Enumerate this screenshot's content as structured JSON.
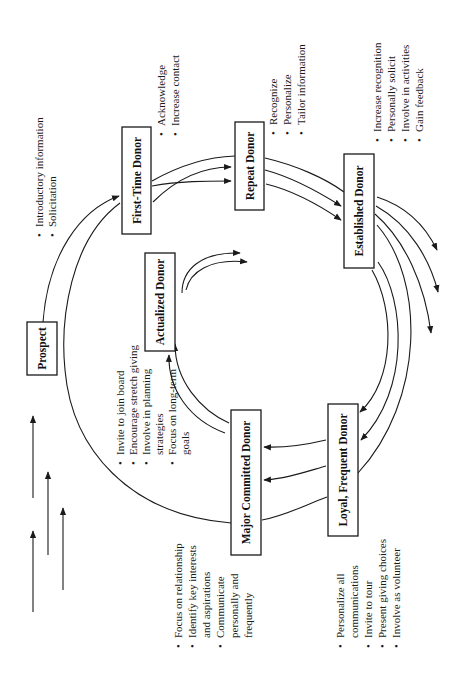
{
  "diagram": {
    "orientation": "rotated 90 degrees counter-clockwise",
    "nodes": [
      {
        "id": "prospect",
        "label": "Prospect"
      },
      {
        "id": "first_time",
        "label": "First-Time Donor"
      },
      {
        "id": "repeat",
        "label": "Repeat Donor"
      },
      {
        "id": "established",
        "label": "Established Donor"
      },
      {
        "id": "loyal",
        "label": "Loyal, Frequent Donor"
      },
      {
        "id": "major",
        "label": "Major Committed Donor"
      },
      {
        "id": "actualized",
        "label": "Actualized Donor"
      }
    ],
    "bullets": {
      "prospect": [
        "Introductory information",
        "Solicitation"
      ],
      "first_time": [
        "Acknowledge",
        "Increase contact"
      ],
      "repeat": [
        "Recognize",
        "Personalize",
        "Tailor information"
      ],
      "established": [
        "Increase recognition",
        "Personally solicit",
        "Involve in activities",
        "Gain feedback"
      ],
      "loyal": [
        "Personalize all",
        "communications",
        "Invite to tour",
        "Present giving choices",
        "Involve as volunteer"
      ],
      "major": [
        "Invite to join board",
        "Encourage stretch giving",
        "Involve in planning",
        "strategies",
        "Focus on long-term",
        "goals"
      ],
      "relationship": [
        "Focus on relationship",
        "Identify key interests",
        "and aspirations",
        "Communicate",
        "personally and",
        "frequently"
      ]
    },
    "edges": [
      {
        "from": "prospect",
        "to": "first_time"
      },
      {
        "from": "first_time",
        "to": "repeat"
      },
      {
        "from": "repeat",
        "to": "established"
      },
      {
        "from": "established",
        "to": "loyal"
      },
      {
        "from": "established",
        "to": "outside"
      },
      {
        "from": "loyal",
        "to": "major"
      },
      {
        "from": "major",
        "to": "actualized"
      },
      {
        "from": "actualized",
        "to": "outside"
      },
      {
        "from": "first_time",
        "to": "major"
      }
    ],
    "bullet_glyph": "•"
  }
}
